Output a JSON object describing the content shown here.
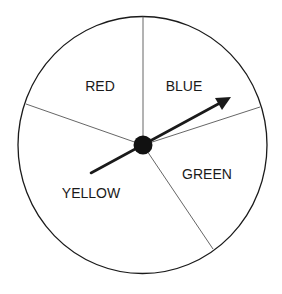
{
  "spinner": {
    "sections": [
      {
        "label": "RED",
        "x": 100,
        "y": 91
      },
      {
        "label": "BLUE",
        "x": 184,
        "y": 91
      },
      {
        "label": "GREEN",
        "x": 207,
        "y": 179
      },
      {
        "label": "YELLOW",
        "x": 91,
        "y": 198
      }
    ],
    "colors": {
      "stroke": "#1a1a1a",
      "divider": "#555555",
      "background": "#ffffff"
    }
  }
}
